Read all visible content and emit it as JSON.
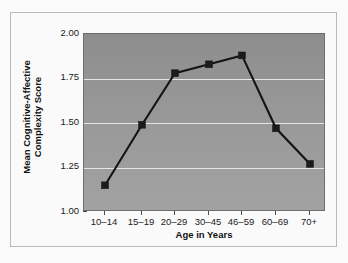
{
  "chart_data": {
    "type": "line",
    "title": "",
    "xlabel": "Age in Years",
    "ylabel_line1": "Mean Cognitive-Affective",
    "ylabel_line2": "Complexity Score",
    "categories": [
      "10–14",
      "15–19",
      "20–29",
      "30–45",
      "46–59",
      "60–69",
      "70+"
    ],
    "values": [
      1.15,
      1.49,
      1.78,
      1.83,
      1.88,
      1.47,
      1.27
    ],
    "series": [
      {
        "name": "Mean Cognitive-Affective Complexity Score",
        "values": [
          1.15,
          1.49,
          1.78,
          1.83,
          1.88,
          1.47,
          1.27
        ]
      }
    ],
    "ylim": [
      1.0,
      2.0
    ],
    "yticks": [
      1.0,
      1.25,
      1.5,
      1.75,
      2.0
    ],
    "ytick_labels": [
      "1.00",
      "1.25",
      "1.50",
      "1.75",
      "2.00"
    ],
    "grid": true,
    "gridlines_at": [
      1.25,
      1.5,
      1.75
    ],
    "legend": "none",
    "marker": "square",
    "colors": {
      "line": "#141414",
      "marker": "#1b1b1b",
      "plot_background": "#979797",
      "gridline": "#eaeaea",
      "figure_background": "#fafafa",
      "frame_border": "#b9b9b9",
      "axis_text": "#1a1a1a"
    }
  }
}
